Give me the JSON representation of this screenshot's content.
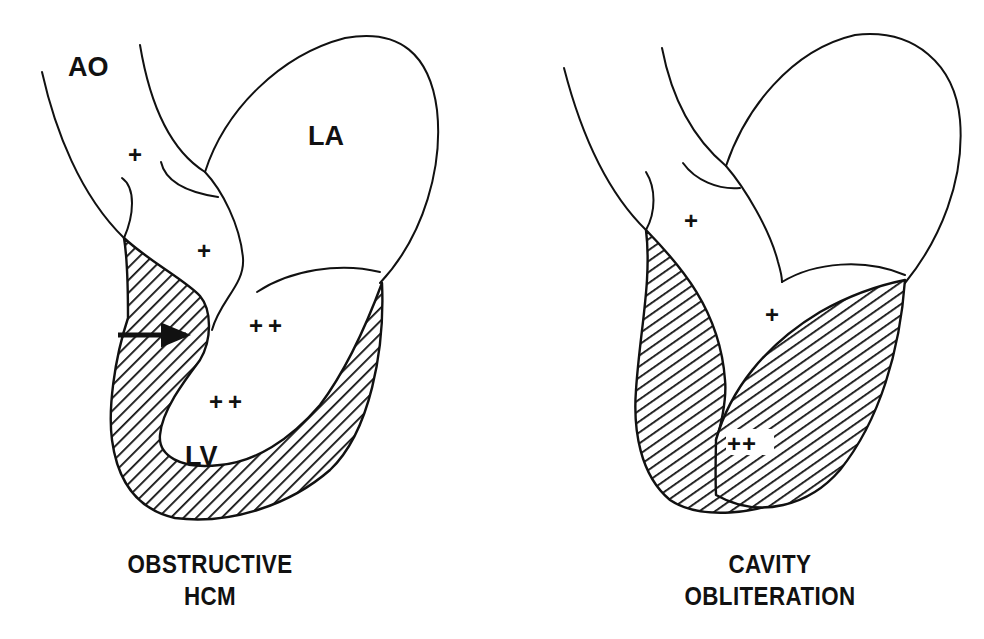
{
  "colors": {
    "ink": "#111111",
    "background": "#ffffff"
  },
  "panels": [
    {
      "id": "obstructive-hcm",
      "caption_line1": "OBSTRUCTIVE",
      "caption_line2": "HCM",
      "labels": {
        "aorta": "AO",
        "left_atrium": "LA",
        "left_ventricle": "LV"
      },
      "pressure_markers": {
        "aorta": "+",
        "outflow_tract": "+",
        "lv_upper": "++",
        "lv_lower": "++"
      },
      "arrow": "septal-contact-arrow"
    },
    {
      "id": "cavity-obliteration",
      "caption_line1": "CAVITY",
      "caption_line2": "OBLITERATION",
      "pressure_markers": {
        "outflow_tract": "+",
        "lv_mid": "+",
        "apex": "++"
      }
    }
  ]
}
